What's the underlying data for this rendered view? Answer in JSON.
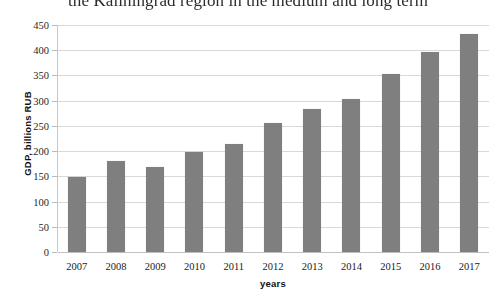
{
  "caption": {
    "text": "the Kaliningrad region in the medium and long term"
  },
  "chart_data": {
    "type": "bar",
    "title": "",
    "xlabel": "years",
    "ylabel": "GDP, billions RUB",
    "categories": [
      "2007",
      "2008",
      "2009",
      "2010",
      "2011",
      "2012",
      "2013",
      "2014",
      "2015",
      "2016",
      "2017"
    ],
    "values": [
      148,
      180,
      169,
      199,
      214,
      256,
      284,
      303,
      353,
      397,
      432
    ],
    "ylim": [
      0,
      450
    ],
    "yticks": [
      0,
      50,
      100,
      150,
      200,
      250,
      300,
      350,
      400,
      450
    ],
    "ytick_labels": [
      "0",
      "50",
      "100",
      "150",
      "200",
      "250",
      "300",
      "350",
      "400",
      "450"
    ],
    "grid": true,
    "legend": "none",
    "series": [
      {
        "name": "GDP",
        "color": "#7f7f7f",
        "values": [
          148,
          180,
          169,
          199,
          214,
          256,
          284,
          303,
          353,
          397,
          432
        ]
      }
    ]
  },
  "colors": {
    "bar": "#7f7f7f",
    "gridline": "#d9d9d9",
    "axis": "#c8c8c8",
    "background": "#ffffff",
    "text": "#1a1a1a"
  }
}
